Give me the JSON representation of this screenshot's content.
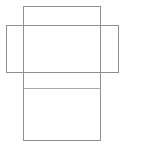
{
  "canvas": {
    "width": 142,
    "height": 149,
    "background_color": "#ffffff"
  },
  "diagram": {
    "name": "box-net-diagram",
    "type": "line-drawing",
    "stroke_color": "#8f8f8f",
    "fold_color": "#a6a6a6",
    "stroke_width": 1,
    "fill": "none",
    "shapes": [
      {
        "id": "vertical-panel",
        "kind": "rectangle",
        "x": 23,
        "y": 6,
        "width": 77,
        "height": 134,
        "stroke": "#8f8f8f"
      },
      {
        "id": "horizontal-panel",
        "kind": "rectangle",
        "x": 6,
        "y": 25,
        "width": 112,
        "height": 47,
        "stroke": "#8f8f8f"
      },
      {
        "id": "fold-line",
        "kind": "line",
        "x1": 23,
        "y1": 88,
        "x2": 100,
        "y2": 88,
        "stroke": "#a6a6a6"
      }
    ]
  }
}
